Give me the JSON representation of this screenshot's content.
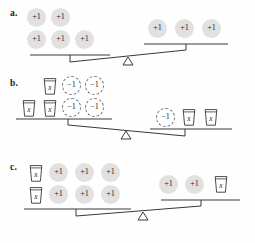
{
  "page": {
    "background": "#fefefe",
    "ink": "#231f20",
    "disc_fill": "#e2e1e2",
    "dashed_stroke": "#6d6a6b",
    "line_stroke": "#3a3738"
  },
  "tokens": {
    "plus_one": "+1",
    "minus_one": "−1",
    "variable": "x"
  },
  "problems": [
    {
      "label": "a.",
      "left_pan": {
        "state": "down",
        "rows": [
          [
            "plus_one",
            "plus_one"
          ],
          [
            "plus_one",
            "plus_one",
            "plus_one"
          ]
        ]
      },
      "right_pan": {
        "state": "up",
        "rows": [
          [
            "plus_one",
            "plus_one",
            "plus_one"
          ]
        ]
      }
    },
    {
      "label": "b.",
      "left_pan": {
        "state": "up",
        "rows": [
          [
            "variable",
            "minus_one",
            "minus_one"
          ],
          [
            "variable",
            "variable",
            "minus_one",
            "minus_one"
          ]
        ]
      },
      "right_pan": {
        "state": "down",
        "rows": [
          [
            "minus_one",
            "variable",
            "variable"
          ]
        ]
      }
    },
    {
      "label": "c.",
      "left_pan": {
        "state": "down",
        "rows": [
          [
            "variable",
            "plus_one",
            "plus_one",
            "plus_one"
          ],
          [
            "variable",
            "plus_one",
            "plus_one",
            "plus_one"
          ]
        ]
      },
      "right_pan": {
        "state": "up",
        "rows": [
          [
            "plus_one",
            "plus_one",
            "variable"
          ]
        ]
      }
    }
  ]
}
